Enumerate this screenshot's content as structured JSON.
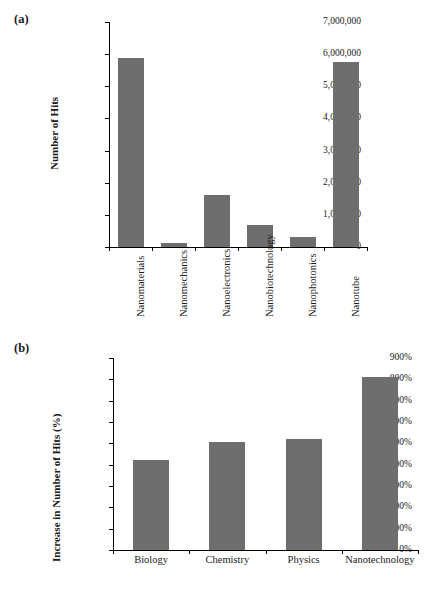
{
  "figure": {
    "panel_a_letter": "(a)",
    "panel_b_letter": "(b)"
  },
  "chart_data": [
    {
      "id": "panel-a",
      "type": "bar",
      "title": "",
      "xlabel": "",
      "ylabel": "Number of Hits",
      "categories": [
        "Nanomaterials",
        "Nanomechanics",
        "Nanoelectronics",
        "Nanobiotechnology",
        "Nanophotonics",
        "Nanotube"
      ],
      "values": [
        5870000,
        130000,
        1630000,
        700000,
        300000,
        5770000
      ],
      "ylim": [
        0,
        7000000
      ],
      "ytick_values": [
        0,
        1000000,
        2000000,
        3000000,
        4000000,
        5000000,
        6000000,
        7000000
      ],
      "ytick_labels": [
        "0",
        "1,000,000",
        "2,000,000",
        "3,000,000",
        "4,000,000",
        "5,000,000",
        "6,000,000",
        "7,000,000"
      ],
      "grid": false,
      "legend": "none",
      "bar_color": "#6e6e6e",
      "label_rotation": -90
    },
    {
      "id": "panel-b",
      "type": "bar",
      "title": "",
      "xlabel": "",
      "ylabel": "Increase in Number of Hits (%)",
      "categories": [
        "Biology",
        "Chemistry",
        "Physics",
        "Nanotechnology"
      ],
      "values": [
        420,
        505,
        520,
        812
      ],
      "ylim": [
        0,
        900
      ],
      "ytick_values": [
        0,
        100,
        200,
        300,
        400,
        500,
        600,
        700,
        800,
        900
      ],
      "ytick_labels": [
        "0%",
        "100%",
        "200%",
        "300%",
        "400%",
        "500%",
        "600%",
        "700%",
        "800%",
        "900%"
      ],
      "grid": false,
      "legend": "none",
      "bar_color": "#6e6e6e",
      "label_rotation": 0
    }
  ]
}
